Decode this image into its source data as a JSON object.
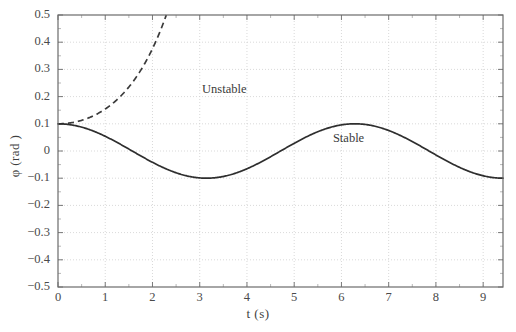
{
  "chart_data": {
    "type": "line",
    "title": "",
    "xlabel": "t (s)",
    "ylabel": "φ (rad )",
    "xlim": [
      0,
      9.42
    ],
    "ylim": [
      -0.5,
      0.5
    ],
    "xticks": [
      "0",
      "1",
      "2",
      "3",
      "4",
      "5",
      "6",
      "7",
      "8",
      "9"
    ],
    "xtick_values": [
      0,
      1,
      2,
      3,
      4,
      5,
      6,
      7,
      8,
      9
    ],
    "yticks": [
      "0.5",
      "0.4",
      "0.3",
      "0.2",
      "0.1",
      "0",
      "−0.1",
      "−0.2",
      "−0.3",
      "−0.4",
      "−0.5"
    ],
    "ytick_values": [
      0.5,
      0.4,
      0.3,
      0.2,
      0.1,
      0.0,
      -0.1,
      -0.2,
      -0.3,
      -0.4,
      -0.5
    ],
    "grid": true,
    "grid_style": "dotted",
    "grid_color": "#cfcfcf",
    "axis_color": "#6b6b6b",
    "legend_position": "inline-annotations",
    "series": [
      {
        "name": "Unstable",
        "style": "dashed",
        "color": "#3a3a3a",
        "annotation": "Unstable",
        "annotation_x": 3.05,
        "annotation_y": 0.225,
        "description": "phi(t) = 0.1*cosh(t) growing exponentially, leaves plot near t = 3.2",
        "x": [
          0.0,
          0.2,
          0.4,
          0.6,
          0.8,
          1.0,
          1.2,
          1.4,
          1.6,
          1.8,
          2.0,
          2.2,
          2.4,
          2.6,
          2.8,
          3.0,
          3.1,
          3.2
        ],
        "y": [
          0.1,
          0.102,
          0.108,
          0.118,
          0.133,
          0.154,
          0.181,
          0.218,
          0.263,
          0.32,
          0.376,
          0.452,
          0.551,
          0.675,
          0.828,
          1.007,
          1.111,
          1.226
        ]
      },
      {
        "name": "Stable",
        "style": "solid",
        "color": "#2e2e2e",
        "annotation": "Stable",
        "annotation_x": 5.82,
        "annotation_y": 0.045,
        "description": "phi(t) = 0.1*cos(t) oscillating between +0.1 and -0.1",
        "x": [
          0.0,
          0.4,
          0.8,
          1.2,
          1.6,
          2.0,
          2.4,
          2.8,
          3.14,
          3.6,
          4.0,
          4.4,
          4.8,
          5.2,
          5.6,
          6.0,
          6.28,
          6.8,
          7.2,
          7.6,
          8.0,
          8.4,
          8.8,
          9.2,
          9.42
        ],
        "y": [
          0.1,
          0.092,
          0.07,
          0.036,
          -0.003,
          -0.042,
          -0.074,
          -0.094,
          -0.1,
          -0.089,
          -0.065,
          -0.031,
          0.009,
          0.046,
          0.079,
          0.096,
          0.1,
          0.087,
          0.061,
          0.025,
          -0.015,
          -0.053,
          -0.082,
          -0.097,
          -0.1
        ]
      }
    ]
  }
}
